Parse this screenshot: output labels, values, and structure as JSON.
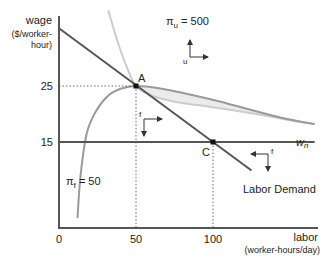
{
  "chart_data": {
    "type": "line",
    "title": "",
    "xlabel": "labor",
    "xlabel_units": "(worker-hours/day)",
    "ylabel": "wage",
    "ylabel_units_line1": "($/worker-",
    "ylabel_units_line2": "hour)",
    "xlim": [
      0,
      170
    ],
    "ylim": [
      0,
      38
    ],
    "x_ticks": [
      {
        "value": 0,
        "label": "0"
      },
      {
        "value": 50,
        "label": "50"
      },
      {
        "value": 100,
        "label": "100"
      }
    ],
    "y_ticks": [
      {
        "value": 25,
        "label": "25"
      },
      {
        "value": 15,
        "label": "15"
      }
    ],
    "grid": false,
    "series": [
      {
        "name": "Labor Demand",
        "label": "Labor Demand",
        "color": "#555555",
        "points": [
          [
            0,
            35.3
          ],
          [
            50,
            25
          ],
          [
            100,
            15
          ],
          [
            125,
            9.9
          ]
        ]
      },
      {
        "name": "w_n",
        "label_main": "w",
        "label_sub": "n",
        "color": "#555555",
        "points": [
          [
            0,
            15
          ],
          [
            166,
            15
          ]
        ]
      },
      {
        "name": "pi_u = 500",
        "label_main": "π",
        "label_sub": "u",
        "label_value": " = 500",
        "color": "#c8c8c8",
        "points": [
          [
            32,
            38.5
          ],
          [
            38,
            33
          ],
          [
            44,
            28.4
          ],
          [
            50,
            25
          ],
          [
            60,
            23.3
          ],
          [
            75,
            22.2
          ],
          [
            90,
            21.6
          ],
          [
            110,
            20.8
          ],
          [
            130,
            19.9
          ],
          [
            150,
            18.9
          ],
          [
            166,
            18.2
          ]
        ]
      },
      {
        "name": "pi_f = 50",
        "label_main": "π",
        "label_sub": "f",
        "label_value": " = 50",
        "color": "#999999",
        "points": [
          [
            12,
            1.4
          ],
          [
            14,
            9
          ],
          [
            18,
            16.5
          ],
          [
            24,
            20.5
          ],
          [
            32,
            23.3
          ],
          [
            40,
            24.5
          ],
          [
            50,
            25
          ],
          [
            65,
            24.6
          ],
          [
            85,
            23.5
          ],
          [
            105,
            22.2
          ],
          [
            125,
            20.7
          ],
          [
            145,
            19.3
          ],
          [
            166,
            18.2
          ]
        ]
      }
    ],
    "points": [
      {
        "label": "A",
        "x": 50,
        "y": 25
      },
      {
        "label": "C",
        "x": 100,
        "y": 15
      }
    ],
    "annotations": [
      {
        "text": "u",
        "meaning": "union improvement direction arrows (up, right)"
      },
      {
        "text": "f",
        "meaning": "firm improvement direction arrows near A (right, down)"
      },
      {
        "text": "f",
        "meaning": "firm improvement direction arrows near C (left, down)"
      }
    ],
    "shaded_region": "lens between π_u = 500 and π_f = 50 curves to the right of A"
  }
}
